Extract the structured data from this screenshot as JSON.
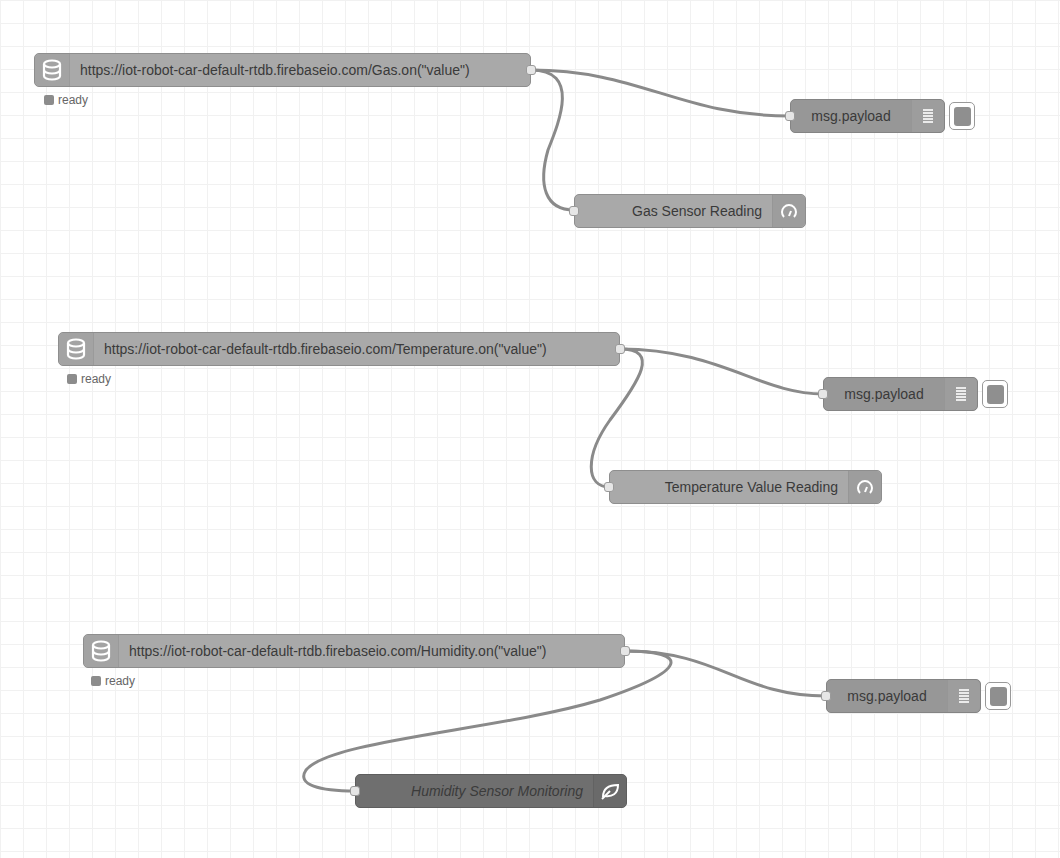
{
  "canvas": {
    "grid_size": 23,
    "background": "#ffffff",
    "wire_color": "#8a8a8a"
  },
  "flows": [
    {
      "source": {
        "label": "https://iot-robot-car-default-rtdb.firebaseio.com/Gas.on(\"value\")",
        "icon": "database-icon",
        "status": "ready"
      },
      "debug": {
        "label": "msg.payload",
        "icon": "list-icon"
      },
      "gauge": {
        "label": "Gas Sensor Reading",
        "icon": "gauge-icon"
      }
    },
    {
      "source": {
        "label": "https://iot-robot-car-default-rtdb.firebaseio.com/Temperature.on(\"value\")",
        "icon": "database-icon",
        "status": "ready"
      },
      "debug": {
        "label": "msg.payload",
        "icon": "list-icon"
      },
      "gauge": {
        "label": "Temperature Value Reading",
        "icon": "gauge-icon"
      }
    },
    {
      "source": {
        "label": "https://iot-robot-car-default-rtdb.firebaseio.com/Humidity.on(\"value\")",
        "icon": "database-icon",
        "status": "ready"
      },
      "debug": {
        "label": "msg.payload",
        "icon": "list-icon"
      },
      "monitor": {
        "label": "Humidity Sensor Monitoring",
        "icon": "leaf-icon",
        "disabled_style": true
      }
    }
  ]
}
